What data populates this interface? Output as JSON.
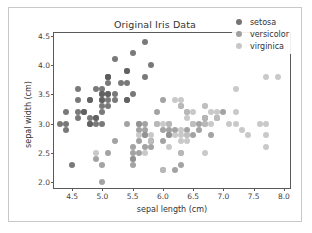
{
  "figure": {
    "title": "Original Iris Data",
    "background": "#ffffff",
    "border_color": "#c8c8c8"
  },
  "axis": {
    "xlabel": "sepal length (cm)",
    "ylabel": "sepal width (cm)",
    "xticks": [
      "4.5",
      "5.0",
      "5.5",
      "6.0",
      "6.5",
      "7.0",
      "7.5",
      "8.0"
    ],
    "yticks": [
      "2.0",
      "2.5",
      "3.0",
      "3.5",
      "4.0",
      "4.5"
    ]
  },
  "legend": {
    "position": "upper-right",
    "items": [
      {
        "label": "setosa",
        "color": "#5c5c5c"
      },
      {
        "label": "versicolor",
        "color": "#8f8f8f"
      },
      {
        "label": "virginica",
        "color": "#bdbdbd"
      }
    ]
  },
  "chart_data": {
    "type": "scatter",
    "title": "Original Iris Data",
    "xlabel": "sepal length (cm)",
    "ylabel": "sepal width (cm)",
    "xlim": [
      4.2,
      8.1
    ],
    "ylim": [
      1.9,
      4.55
    ],
    "grid": false,
    "legend_position": "upper right",
    "series": [
      {
        "name": "setosa",
        "color": "#5c5c5c",
        "points": [
          [
            5.1,
            3.5
          ],
          [
            4.9,
            3.0
          ],
          [
            4.7,
            3.2
          ],
          [
            4.6,
            3.1
          ],
          [
            5.0,
            3.6
          ],
          [
            5.4,
            3.9
          ],
          [
            4.6,
            3.4
          ],
          [
            5.0,
            3.4
          ],
          [
            4.4,
            2.9
          ],
          [
            4.9,
            3.1
          ],
          [
            5.4,
            3.7
          ],
          [
            4.8,
            3.4
          ],
          [
            4.8,
            3.0
          ],
          [
            4.3,
            3.0
          ],
          [
            5.8,
            4.0
          ],
          [
            5.7,
            4.4
          ],
          [
            5.4,
            3.9
          ],
          [
            5.1,
            3.5
          ],
          [
            5.7,
            3.8
          ],
          [
            5.1,
            3.8
          ],
          [
            5.4,
            3.4
          ],
          [
            5.1,
            3.7
          ],
          [
            4.6,
            3.6
          ],
          [
            5.1,
            3.3
          ],
          [
            4.8,
            3.4
          ],
          [
            5.0,
            3.0
          ],
          [
            5.0,
            3.4
          ],
          [
            5.2,
            3.5
          ],
          [
            5.2,
            3.4
          ],
          [
            4.7,
            3.2
          ],
          [
            4.8,
            3.1
          ],
          [
            5.4,
            3.4
          ],
          [
            5.2,
            4.1
          ],
          [
            5.5,
            4.2
          ],
          [
            4.9,
            3.1
          ],
          [
            5.0,
            3.2
          ],
          [
            5.5,
            3.5
          ],
          [
            4.9,
            3.6
          ],
          [
            4.4,
            3.0
          ],
          [
            5.1,
            3.4
          ],
          [
            5.0,
            3.5
          ],
          [
            4.5,
            2.3
          ],
          [
            4.4,
            3.2
          ],
          [
            5.0,
            3.5
          ],
          [
            5.1,
            3.8
          ],
          [
            4.8,
            3.0
          ],
          [
            5.1,
            3.8
          ],
          [
            4.6,
            3.2
          ],
          [
            5.3,
            3.7
          ],
          [
            5.0,
            3.3
          ]
        ]
      },
      {
        "name": "versicolor",
        "color": "#8f8f8f",
        "points": [
          [
            7.0,
            3.2
          ],
          [
            6.4,
            3.2
          ],
          [
            6.9,
            3.1
          ],
          [
            5.5,
            2.3
          ],
          [
            6.5,
            2.8
          ],
          [
            5.7,
            2.8
          ],
          [
            6.3,
            3.3
          ],
          [
            4.9,
            2.4
          ],
          [
            6.6,
            2.9
          ],
          [
            5.2,
            2.7
          ],
          [
            5.0,
            2.0
          ],
          [
            5.9,
            3.0
          ],
          [
            6.0,
            2.2
          ],
          [
            6.1,
            2.9
          ],
          [
            5.6,
            2.9
          ],
          [
            6.7,
            3.1
          ],
          [
            5.6,
            3.0
          ],
          [
            5.8,
            2.7
          ],
          [
            6.2,
            2.2
          ],
          [
            5.6,
            2.5
          ],
          [
            5.9,
            3.2
          ],
          [
            6.1,
            2.8
          ],
          [
            6.3,
            2.5
          ],
          [
            6.1,
            2.8
          ],
          [
            6.4,
            2.9
          ],
          [
            6.6,
            3.0
          ],
          [
            6.8,
            2.8
          ],
          [
            6.7,
            3.0
          ],
          [
            6.0,
            2.9
          ],
          [
            5.7,
            2.6
          ],
          [
            5.5,
            2.4
          ],
          [
            5.5,
            2.4
          ],
          [
            5.8,
            2.7
          ],
          [
            6.0,
            2.7
          ],
          [
            5.4,
            3.0
          ],
          [
            6.0,
            3.4
          ],
          [
            6.7,
            3.1
          ],
          [
            6.3,
            2.3
          ],
          [
            5.6,
            3.0
          ],
          [
            5.5,
            2.5
          ],
          [
            5.5,
            2.6
          ],
          [
            6.1,
            3.0
          ],
          [
            5.8,
            2.6
          ],
          [
            5.0,
            2.3
          ],
          [
            5.6,
            2.7
          ],
          [
            5.7,
            3.0
          ],
          [
            5.7,
            2.9
          ],
          [
            6.2,
            2.9
          ],
          [
            5.1,
            2.5
          ],
          [
            5.7,
            2.8
          ]
        ]
      },
      {
        "name": "virginica",
        "color": "#bdbdbd",
        "points": [
          [
            6.3,
            3.3
          ],
          [
            5.8,
            2.7
          ],
          [
            7.1,
            3.0
          ],
          [
            6.3,
            2.9
          ],
          [
            6.5,
            3.0
          ],
          [
            7.6,
            3.0
          ],
          [
            4.9,
            2.5
          ],
          [
            7.3,
            2.9
          ],
          [
            6.7,
            2.5
          ],
          [
            7.2,
            3.6
          ],
          [
            6.5,
            3.2
          ],
          [
            6.4,
            2.7
          ],
          [
            6.8,
            3.0
          ],
          [
            5.7,
            2.5
          ],
          [
            5.8,
            2.8
          ],
          [
            6.4,
            3.2
          ],
          [
            6.5,
            3.0
          ],
          [
            7.7,
            3.8
          ],
          [
            7.7,
            2.6
          ],
          [
            6.0,
            2.2
          ],
          [
            6.9,
            3.2
          ],
          [
            5.6,
            2.8
          ],
          [
            7.7,
            2.8
          ],
          [
            6.3,
            2.7
          ],
          [
            6.7,
            3.3
          ],
          [
            7.2,
            3.2
          ],
          [
            6.2,
            2.8
          ],
          [
            6.1,
            3.0
          ],
          [
            6.4,
            2.8
          ],
          [
            7.2,
            3.0
          ],
          [
            7.4,
            2.8
          ],
          [
            7.9,
            3.8
          ],
          [
            6.4,
            2.8
          ],
          [
            6.3,
            2.8
          ],
          [
            6.1,
            2.6
          ],
          [
            7.7,
            3.0
          ],
          [
            6.3,
            3.4
          ],
          [
            6.4,
            3.1
          ],
          [
            6.0,
            3.0
          ],
          [
            6.9,
            3.1
          ],
          [
            6.7,
            3.1
          ],
          [
            6.9,
            3.1
          ],
          [
            5.8,
            2.7
          ],
          [
            6.8,
            3.2
          ],
          [
            6.7,
            3.3
          ],
          [
            6.7,
            3.0
          ],
          [
            6.3,
            2.5
          ],
          [
            6.5,
            3.0
          ],
          [
            6.2,
            3.4
          ],
          [
            5.9,
            3.0
          ]
        ]
      }
    ]
  }
}
